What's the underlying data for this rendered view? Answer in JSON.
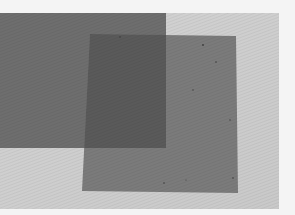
{
  "image": {
    "description": "Photograph of two overlapping translucent grey sheets on a light grey surface",
    "colors": {
      "page_background": "#f5f5f5",
      "surface": "#cfcfcf",
      "sheet_left": "#6e6e6e",
      "sheet_right": "#7b7b7b",
      "overlap": "#5a5a5a"
    }
  }
}
